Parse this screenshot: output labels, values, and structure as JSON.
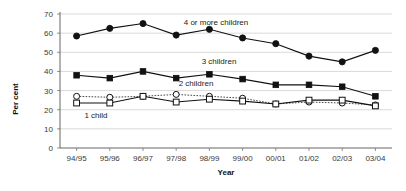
{
  "chart_data": {
    "type": "line",
    "title": "",
    "xlabel": "Year",
    "ylabel": "Per cent",
    "categories": [
      "94/95",
      "95/96",
      "96/97",
      "97/98",
      "98/99",
      "99/00",
      "00/01",
      "01/02",
      "02/03",
      "03/04"
    ],
    "ylim": [
      0,
      70
    ],
    "ytick_step": 10,
    "yticks": [
      "0",
      "10",
      "20",
      "30",
      "40",
      "50",
      "60",
      "70"
    ],
    "grid": "horizontal",
    "legend_position": "inline-annotations",
    "series": [
      {
        "name": "4 or more children",
        "marker": "filled-circle",
        "line": "solid",
        "values": [
          58.5,
          62.5,
          65.0,
          59.0,
          62.0,
          57.5,
          54.5,
          48.0,
          45.0,
          51.0
        ]
      },
      {
        "name": "3 children",
        "marker": "filled-square",
        "line": "solid",
        "values": [
          38.0,
          36.5,
          40.0,
          36.5,
          38.5,
          36.0,
          33.0,
          33.0,
          32.0,
          27.0
        ]
      },
      {
        "name": "2 children",
        "marker": "open-circle",
        "line": "dotted",
        "values": [
          27.0,
          26.5,
          27.0,
          28.0,
          27.0,
          26.0,
          23.0,
          24.0,
          23.5,
          22.5
        ]
      },
      {
        "name": "1 child",
        "marker": "open-square",
        "line": "solid",
        "values": [
          23.5,
          23.5,
          27.0,
          24.0,
          25.5,
          24.5,
          23.0,
          25.0,
          25.0,
          22.0
        ]
      }
    ],
    "annotations": [
      {
        "text": "4 or more children",
        "x_px": 216,
        "y_px": 25
      },
      {
        "text": "3 children",
        "x_px": 219,
        "y_px": 64
      },
      {
        "text": "2 children",
        "x_px": 196,
        "y_px": 86
      },
      {
        "text": "1 child",
        "x_px": 96,
        "y_px": 118
      }
    ],
    "colors": {
      "series_stroke": "#111111",
      "gridline": "#c9c9c9",
      "axis": "#555555",
      "background": "#ffffff",
      "marker_open_fill": "#ffffff"
    }
  }
}
